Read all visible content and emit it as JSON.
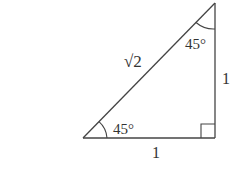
{
  "diagram": {
    "type": "right-triangle",
    "stroke_color": "#444444",
    "text_color": "#333333",
    "vertices": {
      "bottom_left": [
        83,
        138
      ],
      "bottom_right": [
        215,
        138
      ],
      "top": [
        215,
        3
      ]
    },
    "labels": {
      "hypotenuse": "√2",
      "base": "1",
      "height": "1",
      "angle_bottom_left": "45°",
      "angle_top": "45°"
    },
    "right_angle_marker": "bottom-right"
  }
}
